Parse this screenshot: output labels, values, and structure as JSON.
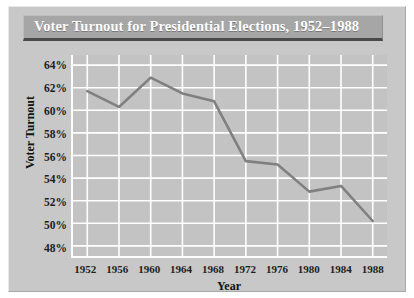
{
  "figure": {
    "title": "Voter Turnout for Presidential Elections, 1952–1988",
    "background_color": "#c8c8c8",
    "plot_background_color": "#c3c3c3",
    "title_banner_color": "#a6a6a6",
    "title_text_color": "#ffffff",
    "gridline_color": "#ffffff",
    "line_color": "#808080"
  },
  "chart_data": {
    "type": "line",
    "title": "Voter Turnout for Presidential Elections, 1952–1988",
    "xlabel": "Year",
    "ylabel": "Voter Turnout",
    "x": [
      1952,
      1956,
      1960,
      1964,
      1968,
      1972,
      1976,
      1980,
      1984,
      1988
    ],
    "xtick_labels": [
      "1952",
      "1956",
      "1960",
      "1964",
      "1968",
      "1972",
      "1976",
      "1980",
      "1984",
      "1988"
    ],
    "values": [
      61.7,
      60.3,
      62.9,
      61.5,
      60.8,
      55.5,
      55.2,
      52.8,
      53.3,
      50.2
    ],
    "ytick_values": [
      64,
      62,
      60,
      58,
      56,
      54,
      52,
      50,
      48
    ],
    "ytick_labels": [
      "64%",
      "62%",
      "60%",
      "58%",
      "56%",
      "54%",
      "52%",
      "50%",
      "48%"
    ],
    "ylim": [
      47.1,
      64.9
    ],
    "xlim": [
      1950.2,
      1989.8
    ],
    "grid": true,
    "legend": null,
    "series_name": "Voter Turnout"
  }
}
